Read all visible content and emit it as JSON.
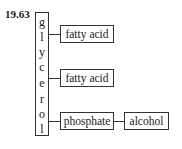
{
  "label": "19.63",
  "glycerol": [
    "g",
    "l",
    "y",
    "c",
    "e",
    "r",
    "o",
    "l"
  ],
  "boxes": {
    "fatty_acid_1": "fatty acid",
    "fatty_acid_2": "fatty acid",
    "phosphate": "phosphate",
    "alcohol": "alcohol"
  }
}
